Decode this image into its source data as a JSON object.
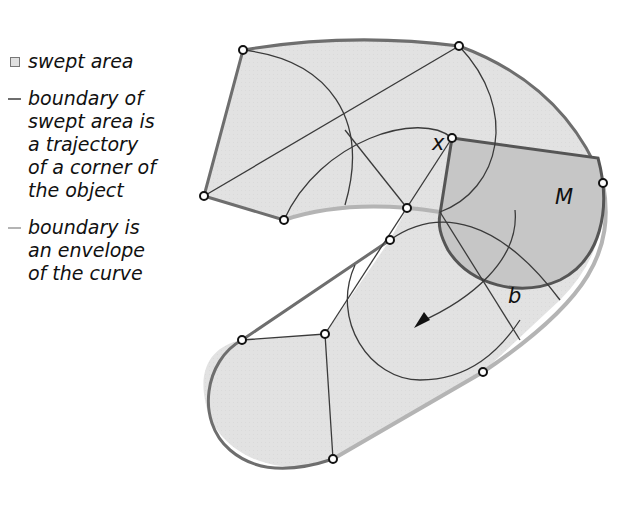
{
  "legend": {
    "items": [
      {
        "swatch": "box",
        "text": "swept area"
      },
      {
        "swatch": "line",
        "color": "#6e6e6e",
        "text": "boundary of\nswept area is\na trajectory\nof a corner of\nthe object"
      },
      {
        "swatch": "line",
        "color": "#b4b4b4",
        "text": "boundary is\nan envelope\nof the curve"
      }
    ]
  },
  "labels": {
    "corner": "x",
    "object": "M",
    "curve": "b"
  },
  "colors": {
    "swept_fill": "#e2e2e2",
    "object_fill": "#c6c6c6",
    "trajectory_stroke": "#6e6e6e",
    "envelope_stroke": "#b4b4b4",
    "construction_stroke": "#3a3a3a"
  }
}
